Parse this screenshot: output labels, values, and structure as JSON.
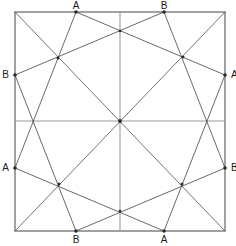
{
  "figure": {
    "canvas": {
      "width": 236,
      "height": 246
    },
    "colors": {
      "background": "#ffffff",
      "outline": "#8a8a8a",
      "midline": "#9a9a9a",
      "chord": "#4d4d4d",
      "diagonal": "#5a5a5a",
      "node": "#2b2b2b",
      "label": "#1a1a1a"
    },
    "square": {
      "left": 15,
      "top": 12,
      "right": 225,
      "bottom": 231,
      "corners": [
        {
          "name": "top-left",
          "x": 15,
          "y": 12
        },
        {
          "name": "top-right",
          "x": 225,
          "y": 12
        },
        {
          "name": "bottom-right",
          "x": 225,
          "y": 231
        },
        {
          "name": "bottom-left",
          "x": 15,
          "y": 231
        }
      ]
    },
    "center": {
      "x": 120,
      "y": 121
    },
    "midlines": [
      {
        "name": "vertical-midline",
        "x1": 120,
        "y1": 12,
        "x2": 120,
        "y2": 231
      },
      {
        "name": "horizontal-midline",
        "x1": 15,
        "y1": 121,
        "x2": 225,
        "y2": 121
      }
    ],
    "diagonals": [
      {
        "name": "diagonal-tl-br",
        "x1": 15,
        "y1": 12,
        "x2": 225,
        "y2": 231
      },
      {
        "name": "diagonal-tr-bl",
        "x1": 225,
        "y1": 12,
        "x2": 15,
        "y2": 231
      }
    ],
    "labeled_points": [
      {
        "id": "A-top",
        "label": "A",
        "x": 76,
        "y": 12,
        "edge": "top",
        "label_x": 76,
        "label_y": 9
      },
      {
        "id": "B-top",
        "label": "B",
        "x": 164,
        "y": 12,
        "edge": "top",
        "label_x": 164,
        "label_y": 9
      },
      {
        "id": "A-right",
        "label": "A",
        "x": 225,
        "y": 75,
        "edge": "right",
        "label_x": 231,
        "label_y": 78
      },
      {
        "id": "B-right",
        "label": "B",
        "x": 225,
        "y": 168,
        "edge": "right",
        "label_x": 231,
        "label_y": 171
      },
      {
        "id": "A-bottom",
        "label": "A",
        "x": 164,
        "y": 231,
        "edge": "bottom",
        "label_x": 164,
        "label_y": 243
      },
      {
        "id": "B-bottom",
        "label": "B",
        "x": 76,
        "y": 231,
        "edge": "bottom",
        "label_x": 76,
        "label_y": 243
      },
      {
        "id": "A-left",
        "label": "A",
        "x": 15,
        "y": 168,
        "edge": "left",
        "label_x": 9,
        "label_y": 171
      },
      {
        "id": "B-left",
        "label": "B",
        "x": 15,
        "y": 75,
        "edge": "left",
        "label_x": 9,
        "label_y": 78
      }
    ],
    "inscribed_squares": [
      {
        "name": "square-A",
        "vertex_ids": [
          "A-top",
          "A-right",
          "A-bottom",
          "A-left"
        ],
        "points": "76,12 225,75 164,231 15,168"
      },
      {
        "name": "square-B",
        "vertex_ids": [
          "B-top",
          "B-right",
          "B-bottom",
          "B-left"
        ],
        "points": "164,12 225,168 76,231 15,75"
      }
    ],
    "intersection_nodes": [
      {
        "name": "node-center",
        "x": 120,
        "y": 121
      },
      {
        "name": "node-upper-left",
        "x": 58,
        "y": 58
      },
      {
        "name": "node-upper-right",
        "x": 183,
        "y": 57
      },
      {
        "name": "node-lower-left",
        "x": 59,
        "y": 184
      },
      {
        "name": "node-lower-right",
        "x": 182,
        "y": 184
      },
      {
        "name": "node-top-mid",
        "x": 120,
        "y": 31
      },
      {
        "name": "node-bottom-mid",
        "x": 120,
        "y": 211
      },
      {
        "name": "node-left-mid",
        "x": 33,
        "y": 121
      },
      {
        "name": "node-right-mid",
        "x": 207,
        "y": 121
      }
    ]
  }
}
